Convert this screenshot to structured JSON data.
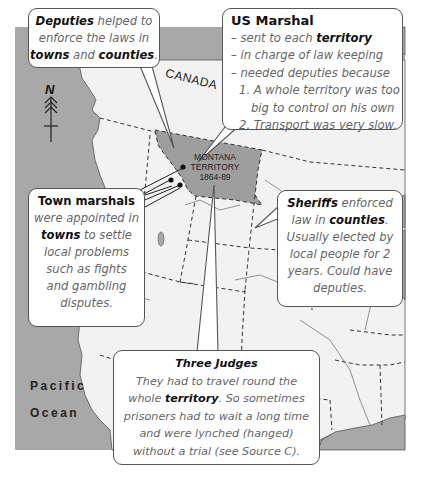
{
  "map": {
    "region_label": "CANADA",
    "territory": {
      "name_line1": "MONTANA",
      "name_line2": "TERRITORY",
      "years": "1864-89"
    },
    "ocean_line1": "Pacific",
    "ocean_line2": "Ocean",
    "compass": {
      "letter": "N",
      "icon": "north-arrow-icon"
    },
    "colors": {
      "water": "#a8a8a8",
      "land": "#f2f2f2",
      "territory": "#9e9e9e",
      "border_lines": "#333333"
    }
  },
  "callouts": {
    "deputies": {
      "b1": "Deputies",
      "t1": " helped to",
      "t2": "enforce the laws in",
      "b2": "towns",
      "t3": " and ",
      "b3": "counties",
      "t4": "."
    },
    "us_marshal": {
      "title": "US Marshal",
      "l1a": "– sent to each ",
      "l1b": "territory",
      "l2": "– in charge of law keeping",
      "l3": "– needed deputies because",
      "l4": "1. A whole territory was too",
      "l5": "big to control on his own",
      "l6": "2. Transport was very slow."
    },
    "town_marshals": {
      "title": "Town marshals",
      "l1": "were appointed in",
      "l2b": "towns",
      "l2": " to settle",
      "l3": "local problems",
      "l4": "such as fights",
      "l5": "and gambling",
      "l6": "disputes."
    },
    "sheriffs": {
      "b1": "Sheriffs",
      "t1": " enforced",
      "t2": "law in ",
      "b2": "counties",
      "t3": ".",
      "l3": "Usually elected by",
      "l4": "local people for 2",
      "l5": "years. Could have",
      "l6": "deputies."
    },
    "judges": {
      "title": "Three Judges",
      "l1": "They had to travel round the",
      "l2a": "whole ",
      "l2b": "territory",
      "l2c": ". So sometimes",
      "l3": "prisoners had to wait a long time",
      "l4": "and were lynched (hanged)",
      "l5": "without a trial (see Source C)."
    }
  }
}
